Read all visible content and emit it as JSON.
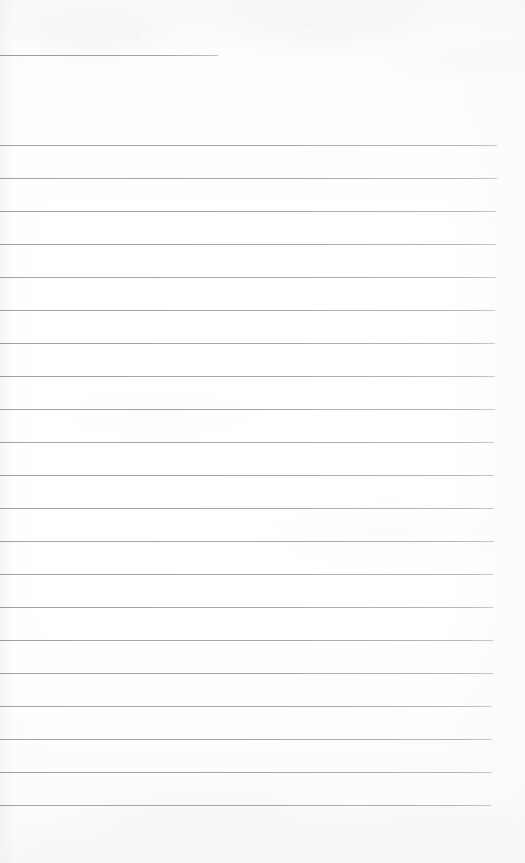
{
  "document": {
    "kind": "scanned-ruled-notebook-page",
    "title": "Blank lined page",
    "page_width": 525,
    "page_height": 863,
    "background_color": "#fdfdfd",
    "rule_color": "#9a9da1",
    "rule_thickness_px": 1,
    "rule_spacing_px": 33,
    "content_text": "",
    "handwriting_present": "no",
    "rules": [
      {
        "name": "header-rule",
        "y": 55,
        "x": 0,
        "width": 218,
        "style": "short"
      },
      {
        "name": "body-rule-1",
        "y": 145,
        "x": 0,
        "width": 497,
        "style": "full"
      },
      {
        "name": "body-rule-2",
        "y": 178,
        "x": 0,
        "width": 497,
        "style": "full"
      },
      {
        "name": "body-rule-3",
        "y": 211,
        "x": 0,
        "width": 496,
        "style": "full"
      },
      {
        "name": "body-rule-4",
        "y": 244,
        "x": 0,
        "width": 496,
        "style": "full"
      },
      {
        "name": "body-rule-5",
        "y": 277,
        "x": 0,
        "width": 496,
        "style": "full"
      },
      {
        "name": "body-rule-6",
        "y": 310,
        "x": 0,
        "width": 495,
        "style": "full"
      },
      {
        "name": "body-rule-7",
        "y": 343,
        "x": 0,
        "width": 495,
        "style": "full"
      },
      {
        "name": "body-rule-8",
        "y": 376,
        "x": 0,
        "width": 495,
        "style": "full"
      },
      {
        "name": "body-rule-9",
        "y": 409,
        "x": 0,
        "width": 495,
        "style": "full"
      },
      {
        "name": "body-rule-10",
        "y": 442,
        "x": 0,
        "width": 494,
        "style": "full"
      },
      {
        "name": "body-rule-11",
        "y": 475,
        "x": 0,
        "width": 494,
        "style": "full"
      },
      {
        "name": "body-rule-12",
        "y": 508,
        "x": 0,
        "width": 494,
        "style": "full"
      },
      {
        "name": "body-rule-13",
        "y": 541,
        "x": 0,
        "width": 494,
        "style": "full"
      },
      {
        "name": "body-rule-14",
        "y": 574,
        "x": 0,
        "width": 493,
        "style": "full"
      },
      {
        "name": "body-rule-15",
        "y": 607,
        "x": 0,
        "width": 493,
        "style": "full"
      },
      {
        "name": "body-rule-16",
        "y": 640,
        "x": 0,
        "width": 493,
        "style": "full"
      },
      {
        "name": "body-rule-17",
        "y": 673,
        "x": 0,
        "width": 493,
        "style": "full"
      },
      {
        "name": "body-rule-18",
        "y": 706,
        "x": 0,
        "width": 492,
        "style": "full"
      },
      {
        "name": "body-rule-19",
        "y": 739,
        "x": 0,
        "width": 492,
        "style": "full"
      },
      {
        "name": "body-rule-20",
        "y": 772,
        "x": 0,
        "width": 492,
        "style": "full"
      },
      {
        "name": "body-rule-21",
        "y": 805,
        "x": 0,
        "width": 491,
        "style": "full"
      }
    ]
  }
}
